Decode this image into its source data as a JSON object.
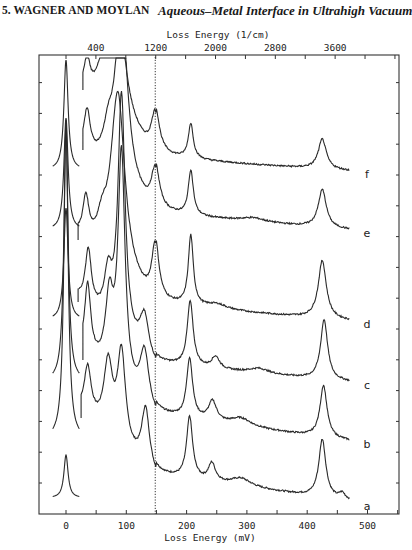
{
  "header": {
    "chapter": "5.   WAGNER AND MOYLAN",
    "running_title": "Aqueous–Metal Interface in Ultrahigh Vacuum"
  },
  "chart_data": {
    "type": "line",
    "title": "",
    "xlabel": "Loss Energy  (mV)",
    "x2label": "Loss Energy  (1/cm)",
    "ylabel": "",
    "xlim": [
      -47,
      553
    ],
    "xticks": [
      0,
      100,
      200,
      300,
      400,
      500
    ],
    "xtick_labels": [
      "0",
      "100",
      "200",
      "300",
      "400",
      "500"
    ],
    "x2ticks_cm": [
      400,
      1200,
      2000,
      2800,
      3600
    ],
    "x2tick_labels": [
      "400",
      "1200",
      "2000",
      "2800",
      "3600"
    ],
    "reference_line": {
      "x_mV": 148,
      "x_cm": 1200,
      "style": "dotted"
    },
    "grid": false,
    "legend": "none (traces labeled a-f at right end)",
    "series": [
      {
        "name": "a",
        "baseline_px": 506,
        "elastic_top_px": 455,
        "elastic_start_px": 498,
        "gain_start_mV": 25,
        "peaks": [
          [
            36,
            48,
            7
          ],
          [
            70,
            70,
            9
          ],
          [
            92,
            92,
            8
          ],
          [
            132,
            60,
            8
          ],
          [
            205,
            62,
            6
          ],
          [
            242,
            18,
            7
          ],
          [
            290,
            8,
            20
          ],
          [
            425,
            58,
            7
          ],
          [
            458,
            6,
            6
          ]
        ],
        "tail": [
          [
            150,
            30
          ],
          [
            470,
            5
          ]
        ]
      },
      {
        "name": "b",
        "baseline_px": 444,
        "elastic_top_px": 120,
        "elastic_start_px": 440,
        "gain_start_mV": 28,
        "peaks": [
          [
            36,
            70,
            6
          ],
          [
            72,
            72,
            8
          ],
          [
            92,
            230,
            7
          ],
          [
            130,
            55,
            9
          ],
          [
            205,
            60,
            6
          ],
          [
            243,
            20,
            8
          ],
          [
            290,
            8,
            20
          ],
          [
            427,
            52,
            7
          ]
        ],
        "tail": [
          [
            150,
            28
          ],
          [
            470,
            3
          ]
        ]
      },
      {
        "name": "c",
        "baseline_px": 385,
        "elastic_top_px": 128,
        "elastic_start_px": 382,
        "gain_start_mV": 20,
        "peaks": [
          [
            37,
            55,
            6
          ],
          [
            70,
            45,
            8
          ],
          [
            92,
            240,
            7
          ],
          [
            130,
            40,
            9
          ],
          [
            206,
            65,
            6
          ],
          [
            248,
            12,
            8
          ],
          [
            320,
            5,
            20
          ],
          [
            428,
            60,
            7
          ]
        ],
        "tail": [
          [
            150,
            20
          ],
          [
            470,
            3
          ]
        ]
      },
      {
        "name": "d",
        "baseline_px": 324,
        "elastic_top_px": 208,
        "elastic_start_px": 320,
        "gain_start_mV": 20,
        "peaks": [
          [
            33,
            40,
            6
          ],
          [
            60,
            25,
            10
          ],
          [
            86,
            180,
            14
          ],
          [
            148,
            60,
            7
          ],
          [
            207,
            70,
            5
          ],
          [
            250,
            5,
            20
          ],
          [
            425,
            58,
            8
          ]
        ],
        "tail": [
          [
            150,
            18
          ],
          [
            470,
            3
          ]
        ]
      },
      {
        "name": "e",
        "baseline_px": 233,
        "elastic_top_px": 118,
        "elastic_start_px": 230,
        "gain_start_mV": 28,
        "peaks": [
          [
            35,
            40,
            6
          ],
          [
            70,
            30,
            10
          ],
          [
            92,
            180,
            12
          ],
          [
            148,
            45,
            8
          ],
          [
            207,
            45,
            5
          ],
          [
            310,
            4,
            25
          ],
          [
            425,
            38,
            8
          ]
        ],
        "tail": [
          [
            150,
            18
          ],
          [
            470,
            3
          ]
        ]
      },
      {
        "name": "f",
        "baseline_px": 174,
        "elastic_top_px": 60,
        "elastic_start_px": 170,
        "gain_start_mV": 28,
        "peaks": [
          [
            35,
            30,
            6
          ],
          [
            60,
            20,
            10
          ],
          [
            83,
            140,
            16
          ],
          [
            148,
            45,
            8
          ],
          [
            207,
            35,
            5
          ],
          [
            425,
            30,
            8
          ]
        ],
        "tail": [
          [
            150,
            15
          ],
          [
            470,
            3
          ]
        ]
      }
    ],
    "series_labels": [
      "a",
      "b",
      "c",
      "d",
      "e",
      "f"
    ],
    "notable_peaks_mV": [
      0,
      36,
      70,
      92,
      148,
      205,
      243,
      425
    ]
  },
  "colors": {
    "line": "#2a2a2a",
    "frame": "#333333",
    "background": "#ffffff"
  }
}
